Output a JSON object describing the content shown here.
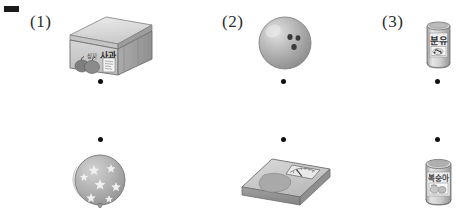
{
  "page": {
    "background_color": "#ffffff",
    "registration_mark": {
      "name": "registration-mark",
      "color": "#1a1a1a"
    }
  },
  "labels": {
    "item1": "(1)",
    "item2": "(2)",
    "item3": "(3)"
  },
  "top_row": [
    {
      "number": "(1)",
      "object": "apple-box",
      "object_label": "사과",
      "object_label_small": "상자",
      "dot": {
        "x": 100,
        "y": 81
      }
    },
    {
      "number": "(2)",
      "object": "bowling-ball",
      "object_label": "",
      "dot": {
        "x": 283,
        "y": 81
      }
    },
    {
      "number": "(3)",
      "object": "powdered-milk-can",
      "object_label": "분유",
      "dot": {
        "x": 437,
        "y": 81
      }
    }
  ],
  "bottom_row": [
    {
      "object": "star-balloon",
      "object_label": "",
      "dot": {
        "x": 100,
        "y": 139
      }
    },
    {
      "object": "bathroom-scale",
      "object_label": "",
      "dot": {
        "x": 283,
        "y": 139
      }
    },
    {
      "object": "canned-food-tin",
      "object_label": "",
      "dot": {
        "x": 437,
        "y": 139
      }
    }
  ],
  "colors": {
    "ink": "#2b2b2b",
    "dot": "#111111",
    "object_light": "#d8d8d8",
    "object_mid": "#b4b4b4",
    "object_dark": "#8d8d8d",
    "outline": "#6e6e6e"
  }
}
